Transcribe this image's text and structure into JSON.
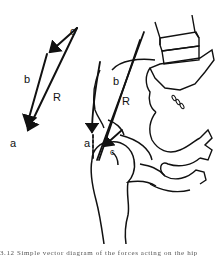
{
  "figure": {
    "vector_diagram": {
      "labels": {
        "c": "c",
        "b": "b",
        "R": "R",
        "a": "a"
      }
    },
    "anatomy": {
      "labels": {
        "b": "b",
        "R": "R",
        "a": "a",
        "c": "c"
      }
    },
    "caption": "3.12   Simple vector diagram of the forces acting on the hip"
  }
}
